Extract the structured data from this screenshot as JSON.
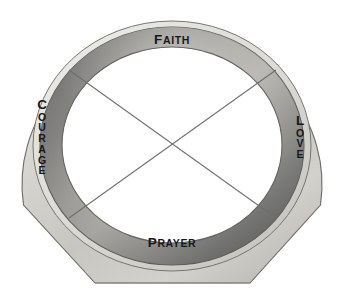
{
  "diagram": {
    "type": "concentric-ring-wheel",
    "background_color": "#ffffff",
    "outline_color": "#5a5a5a",
    "ring": {
      "outer_band_color_light": "#d8d7d2",
      "outer_band_color_mid": "#bcbbb5",
      "inner_band_color_light": "#c9c8c3",
      "inner_band_color_dark": "#6e6e6c",
      "hub_color": "#ffffff",
      "spoke_color": "#6b6b6b"
    },
    "labels": [
      {
        "id": "faith",
        "text": "FAITH",
        "initial": "F",
        "rest": "AITH",
        "position": "top",
        "orientation": "horizontal"
      },
      {
        "id": "love",
        "text": "LOVE",
        "initial": "L",
        "rest": "OVE",
        "letters": [
          "L",
          "O",
          "V",
          "E"
        ],
        "position": "right",
        "orientation": "vertical-stacked"
      },
      {
        "id": "prayer",
        "text": "PRAYER",
        "initial": "P",
        "rest": "RAYER",
        "position": "bottom",
        "orientation": "horizontal"
      },
      {
        "id": "courage",
        "text": "COURAGE",
        "initial": "C",
        "rest": "OURAGE",
        "letters": [
          "C",
          "O",
          "U",
          "R",
          "A",
          "G",
          "E"
        ],
        "position": "left",
        "orientation": "vertical-stacked"
      }
    ],
    "spokes": {
      "count": 2,
      "description": "two crossing diagonal chords forming an X",
      "center": {
        "x": 172,
        "y": 143
      }
    }
  }
}
